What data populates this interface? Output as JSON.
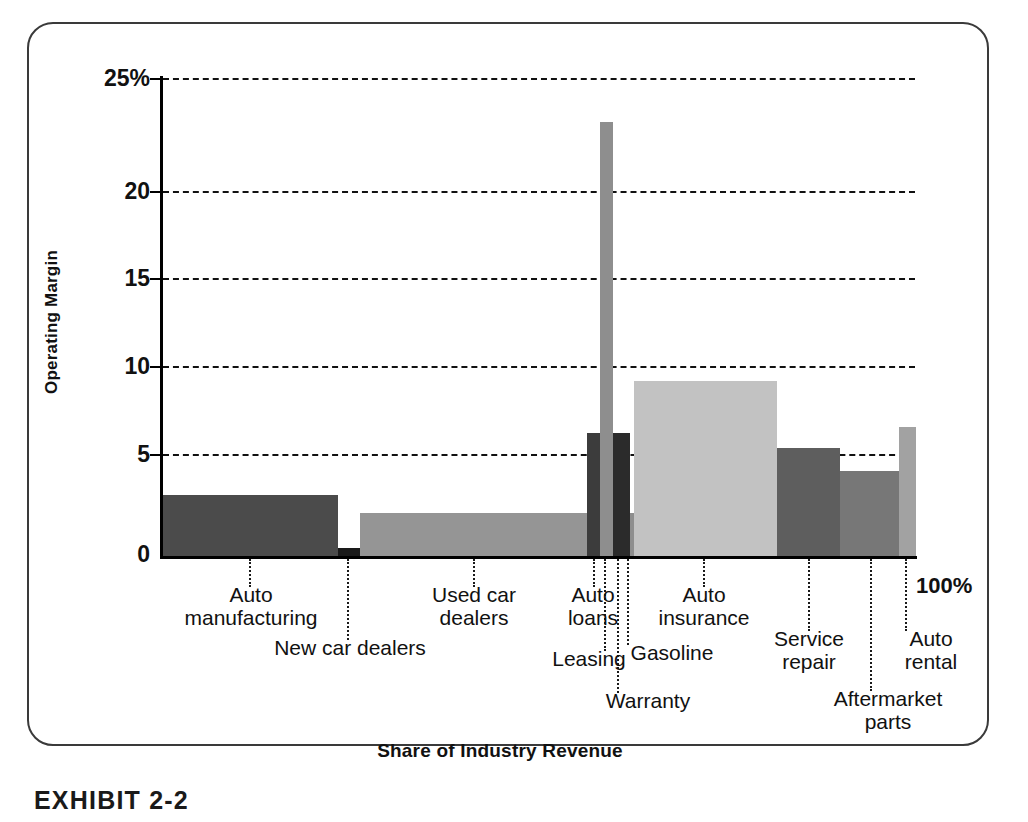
{
  "figure": {
    "caption": "EXHIBIT 2-2"
  },
  "chart_data": {
    "type": "bar",
    "title": "",
    "subtitle": "",
    "xlabel": "Share of Industry Revenue",
    "ylabel": "Operating Margin",
    "ylim": [
      0,
      25
    ],
    "xlim": [
      0,
      100
    ],
    "grid": true,
    "legend": null,
    "note": "Marimekko / variable-width bar chart: bar width = share of industry revenue (%), bar height = operating margin (%)",
    "y_ticks": [
      "0",
      "5",
      "10",
      "15",
      "20",
      "25%"
    ],
    "y_tick_values": [
      0,
      5,
      10,
      15,
      20,
      25
    ],
    "x_end_label": "100%",
    "categories": [
      "Auto manufacturing",
      "New car dealers",
      "Used car dealers",
      "Auto loans",
      "Leasing",
      "Warranty",
      "Gasoline",
      "Auto insurance",
      "Service repair",
      "Aftermarket parts",
      "Auto rental"
    ],
    "bars": [
      {
        "label": "Auto manufacturing",
        "label_lines": "Auto\nmanufacturing",
        "operating_margin": 3.2,
        "revenue_share_start": 0.0,
        "revenue_share_end": 23.5,
        "revenue_share_width": 23.5,
        "color": "#4b4b4b",
        "shade": "dark",
        "px": {
          "left": 163,
          "right": 338,
          "top": 495
        },
        "leader": {
          "x": 249,
          "top": 559,
          "height": 28
        },
        "label_pos": {
          "left": 165,
          "top": 584,
          "width": 172
        }
      },
      {
        "label": "New car dealers",
        "label_lines": "New car dealers",
        "operating_margin": 0.4,
        "revenue_share_start": 23.5,
        "revenue_share_end": 26.5,
        "revenue_share_width": 3.0,
        "color": "#1a1a1a",
        "shade": "darkest",
        "px": {
          "left": 338,
          "right": 360,
          "top": 548
        },
        "leader": {
          "x": 347,
          "top": 559,
          "height": 81
        },
        "label_pos": {
          "left": 255,
          "top": 637,
          "width": 190
        }
      },
      {
        "label": "Used car dealers",
        "label_lines": "Used car\ndealers",
        "operating_margin": 2.1,
        "revenue_share_start": 26.5,
        "revenue_share_end": 56.5,
        "revenue_share_width": 30.0,
        "color": "#959595",
        "shade": "medium",
        "px": {
          "left": 360,
          "right": 587,
          "top": 513
        },
        "leader": {
          "x": 473,
          "top": 559,
          "height": 28
        },
        "label_pos": {
          "left": 398,
          "top": 584,
          "width": 152
        }
      },
      {
        "label": "Auto loans",
        "label_lines": "Auto\nloans",
        "operating_margin": 6.1,
        "revenue_share_start": 56.5,
        "revenue_share_end": 58.2,
        "revenue_share_width": 1.7,
        "color": "#3c3c3c",
        "shade": "dark",
        "px": {
          "left": 587,
          "right": 600,
          "top": 433
        },
        "leader": {
          "x": 593,
          "top": 559,
          "height": 28
        },
        "label_pos": {
          "left": 545,
          "top": 584,
          "width": 96
        }
      },
      {
        "label": "Leasing",
        "label_lines": "Leasing",
        "operating_margin": 23.0,
        "revenue_share_start": 58.2,
        "revenue_share_end": 59.9,
        "revenue_share_width": 1.7,
        "color": "#8e8e8e",
        "shade": "medium",
        "px": {
          "left": 600,
          "right": 613,
          "top": 122
        },
        "leader": {
          "x": 604,
          "top": 559,
          "height": 92
        },
        "label_pos": {
          "left": 533,
          "top": 648,
          "width": 112
        }
      },
      {
        "label": "Warranty",
        "label_lines": "Warranty",
        "operating_margin": 6.1,
        "revenue_share_start": 59.9,
        "revenue_share_end": 62.1,
        "revenue_share_width": 2.2,
        "color": "#2b2b2b",
        "shade": "darkest",
        "px": {
          "left": 613,
          "right": 630,
          "top": 433
        },
        "leader": {
          "x": 617,
          "top": 559,
          "height": 134
        },
        "label_pos": {
          "left": 588,
          "top": 690,
          "width": 120
        }
      },
      {
        "label": "Gasoline",
        "label_lines": "Gasoline",
        "operating_margin": 2.1,
        "revenue_share_start": 62.1,
        "revenue_share_end": 62.6,
        "revenue_share_width": 0.5,
        "color": "#8e8e8e",
        "shade": "medium",
        "px": {
          "left": 630,
          "right": 634,
          "top": 513
        },
        "leader": {
          "x": 627,
          "top": 559,
          "height": 86
        },
        "label_pos": {
          "left": 613,
          "top": 642,
          "width": 118
        }
      },
      {
        "label": "Auto insurance",
        "label_lines": "Auto\ninsurance",
        "operating_margin": 9.2,
        "revenue_share_start": 62.6,
        "revenue_share_end": 81.5,
        "revenue_share_width": 18.9,
        "color": "#c2c2c2",
        "shade": "light",
        "px": {
          "left": 634,
          "right": 777,
          "top": 381
        },
        "leader": {
          "x": 703,
          "top": 559,
          "height": 28
        },
        "label_pos": {
          "left": 633,
          "top": 584,
          "width": 142
        }
      },
      {
        "label": "Service repair",
        "label_lines": "Service\nrepair",
        "operating_margin": 5.3,
        "revenue_share_start": 81.5,
        "revenue_share_end": 89.8,
        "revenue_share_width": 8.3,
        "color": "#5e5e5e",
        "shade": "dark",
        "px": {
          "left": 777,
          "right": 840,
          "top": 448
        },
        "leader": {
          "x": 808,
          "top": 559,
          "height": 72
        },
        "label_pos": {
          "left": 742,
          "top": 628,
          "width": 134
        }
      },
      {
        "label": "Aftermarket parts",
        "label_lines": "Aftermarket\nparts",
        "operating_margin": 4.2,
        "revenue_share_start": 89.8,
        "revenue_share_end": 97.6,
        "revenue_share_width": 7.8,
        "color": "#777777",
        "shade": "medium-dark",
        "px": {
          "left": 840,
          "right": 899,
          "top": 471
        },
        "leader": {
          "x": 870,
          "top": 559,
          "height": 132
        },
        "label_pos": {
          "left": 808,
          "top": 688,
          "width": 160
        }
      },
      {
        "label": "Auto rental",
        "label_lines": "Auto\nrental",
        "operating_margin": 6.5,
        "revenue_share_start": 97.6,
        "revenue_share_end": 100.0,
        "revenue_share_width": 2.4,
        "color": "#a2a2a2",
        "shade": "medium",
        "px": {
          "left": 899,
          "right": 916,
          "top": 427
        },
        "leader": {
          "x": 905,
          "top": 559,
          "height": 72
        },
        "label_pos": {
          "left": 876,
          "top": 628,
          "width": 110
        }
      }
    ],
    "colors": {
      "axis": "#000000",
      "grid": "#111111",
      "frame": "#3a3a3a",
      "text": "#111111",
      "background": "#ffffff"
    }
  }
}
